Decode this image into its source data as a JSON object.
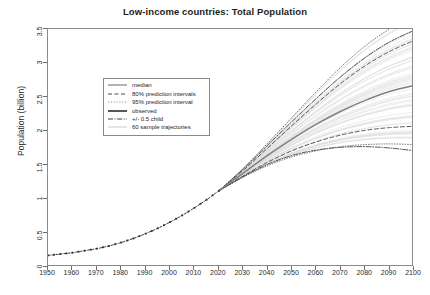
{
  "chart_data": {
    "type": "line",
    "title": "Low-income countries: Total Population",
    "xlabel": "",
    "ylabel": "Population (billion)",
    "xlim": [
      1950,
      2100
    ],
    "ylim": [
      0,
      3.5
    ],
    "xticks": [
      1950,
      1960,
      1970,
      1980,
      1990,
      2000,
      2010,
      2020,
      2030,
      2040,
      2050,
      2060,
      2070,
      2080,
      2090,
      2100
    ],
    "xticklabels": [
      "1950",
      "1960",
      "1970",
      "1980",
      "1990",
      "2000",
      "2010",
      "2020",
      "2030",
      "2040",
      "2050",
      "2060",
      "2070",
      "2080",
      "2090",
      "2100"
    ],
    "yticks": [
      0,
      0.5,
      1,
      1.5,
      2,
      2.5,
      3,
      3.5
    ],
    "yticklabels": [
      "0",
      "0.5",
      "1",
      "1.5",
      "2",
      "2.5",
      "3",
      "3.5"
    ],
    "grid": false,
    "legend_position": "upper left inside",
    "x": [
      1950,
      1960,
      1970,
      1980,
      1990,
      2000,
      2010,
      2020,
      2030,
      2040,
      2050,
      2060,
      2070,
      2080,
      2090,
      2100
    ],
    "series": [
      {
        "name": "observed",
        "style": "solid-dotted-markers",
        "color": "#3a3a3a",
        "x": [
          1950,
          1955,
          1960,
          1965,
          1970,
          1975,
          1980,
          1985,
          1990,
          1995,
          2000,
          2005,
          2010,
          2015,
          2020
        ],
        "values": [
          0.17,
          0.19,
          0.21,
          0.24,
          0.27,
          0.31,
          0.36,
          0.42,
          0.49,
          0.57,
          0.66,
          0.76,
          0.87,
          0.99,
          1.12
        ]
      },
      {
        "name": "median",
        "style": "solid",
        "color": "#808080",
        "x": [
          2020,
          2030,
          2040,
          2050,
          2060,
          2070,
          2080,
          2090,
          2100
        ],
        "values": [
          1.12,
          1.38,
          1.64,
          1.88,
          2.1,
          2.29,
          2.45,
          2.58,
          2.67
        ]
      },
      {
        "name": "80% prediction intervals",
        "style": "dashed",
        "color": "#4a4a4a",
        "bands": [
          {
            "bound": "upper",
            "x": [
              2020,
              2030,
              2040,
              2050,
              2060,
              2070,
              2080,
              2090,
              2100
            ],
            "values": [
              1.12,
              1.42,
              1.75,
              2.08,
              2.4,
              2.7,
              2.96,
              3.17,
              3.33
            ]
          },
          {
            "bound": "lower",
            "x": [
              2020,
              2030,
              2040,
              2050,
              2060,
              2070,
              2080,
              2090,
              2100
            ],
            "values": [
              1.12,
              1.34,
              1.54,
              1.71,
              1.84,
              1.94,
              2.01,
              2.05,
              2.07
            ]
          }
        ]
      },
      {
        "name": "95% prediction interval",
        "style": "dotted",
        "color": "#4a4a4a",
        "bands": [
          {
            "bound": "upper",
            "x": [
              2020,
              2030,
              2040,
              2050,
              2060,
              2070,
              2080,
              2090,
              2100
            ],
            "values": [
              1.12,
              1.45,
              1.82,
              2.2,
              2.58,
              2.94,
              3.25,
              3.5,
              3.7
            ]
          },
          {
            "bound": "lower",
            "x": [
              2020,
              2030,
              2040,
              2050,
              2060,
              2070,
              2080,
              2090,
              2100
            ],
            "values": [
              1.12,
              1.32,
              1.49,
              1.62,
              1.71,
              1.77,
              1.8,
              1.81,
              1.8
            ]
          }
        ]
      },
      {
        "name": "+/- 0.5 child",
        "style": "dash-dot",
        "color": "#3f3f3f",
        "bands": [
          {
            "bound": "upper",
            "x": [
              2020,
              2030,
              2040,
              2050,
              2060,
              2070,
              2080,
              2090,
              2100
            ],
            "values": [
              1.12,
              1.44,
              1.79,
              2.14,
              2.48,
              2.8,
              3.08,
              3.31,
              3.48
            ]
          },
          {
            "bound": "lower",
            "x": [
              2020,
              2030,
              2040,
              2050,
              2060,
              2070,
              2080,
              2090,
              2100
            ],
            "values": [
              1.12,
              1.33,
              1.51,
              1.64,
              1.72,
              1.76,
              1.77,
              1.75,
              1.71
            ]
          }
        ]
      },
      {
        "name": "60 sample trajectories",
        "style": "solid-thin",
        "color": "#d8d8d8",
        "count": 60
      }
    ]
  },
  "legend": {
    "items": [
      {
        "label": "median",
        "style": "solid",
        "color": "#808080"
      },
      {
        "label": "80% prediction intervals",
        "style": "dashed",
        "color": "#4a4a4a"
      },
      {
        "label": "95% prediction interval",
        "style": "dotted",
        "color": "#4a4a4a"
      },
      {
        "label": "observed",
        "style": "solid-thick",
        "color": "#2e2e2e"
      },
      {
        "label": "+/- 0.5 child",
        "style": "dash-dot",
        "color": "#3f3f3f"
      },
      {
        "label": "60 sample trajectories",
        "style": "solid-thin",
        "color": "#cfcfcf"
      }
    ]
  },
  "colors": {
    "axis": "#8a8a8a",
    "text": "#1d1d1d",
    "median": "#808080",
    "observed": "#2e2e2e",
    "trajectories": "#d8d8d8",
    "background": "#ffffff"
  }
}
